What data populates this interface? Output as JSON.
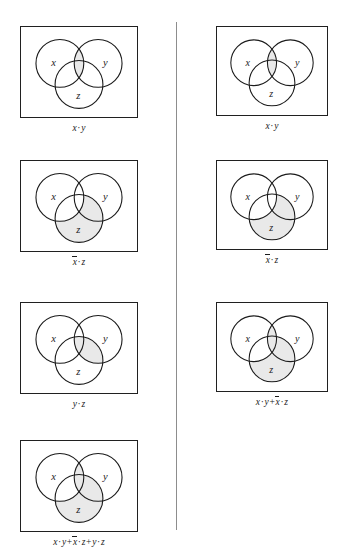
{
  "page": {
    "shade_color": "#e9e9e9",
    "outline_color": "#1b1b1b",
    "divider_color": "#8d8d8d",
    "set_labels": {
      "x": "x",
      "y": "y",
      "z": "z"
    }
  },
  "left_column": {
    "figures": [
      {
        "id": "left-xy",
        "caption": "x · y",
        "caption_parts": [
          {
            "kind": "var",
            "text": "x",
            "bar": false
          },
          {
            "kind": "dot",
            "text": "·"
          },
          {
            "kind": "var",
            "text": "y",
            "bar": false
          }
        ],
        "shaded_regions": [
          "x_and_y_only",
          "x_and_y_and_z"
        ],
        "labels": {
          "x": "x",
          "y": "y",
          "z": "z"
        }
      },
      {
        "id": "left-notx-z",
        "caption": "x̄ · z",
        "caption_parts": [
          {
            "kind": "var",
            "text": "x",
            "bar": true
          },
          {
            "kind": "dot",
            "text": "·"
          },
          {
            "kind": "var",
            "text": "z",
            "bar": false
          }
        ],
        "shaded_regions": [
          "z_only",
          "y_and_z_only"
        ],
        "labels": {
          "x": "x",
          "y": "y",
          "z": "z"
        }
      },
      {
        "id": "left-yz",
        "caption": "y · z",
        "caption_parts": [
          {
            "kind": "var",
            "text": "y",
            "bar": false
          },
          {
            "kind": "dot",
            "text": "·"
          },
          {
            "kind": "var",
            "text": "z",
            "bar": false
          }
        ],
        "shaded_regions": [
          "y_and_z_only",
          "x_and_y_and_z"
        ],
        "labels": {
          "x": "x",
          "y": "y",
          "z": "z"
        }
      },
      {
        "id": "left-sum-three",
        "caption": "x · y + x̄ · z + y · z",
        "caption_parts": [
          {
            "kind": "var",
            "text": "x",
            "bar": false
          },
          {
            "kind": "dot",
            "text": "·"
          },
          {
            "kind": "var",
            "text": "y",
            "bar": false
          },
          {
            "kind": "op",
            "text": "+"
          },
          {
            "kind": "var",
            "text": "x",
            "bar": true
          },
          {
            "kind": "dot",
            "text": "·"
          },
          {
            "kind": "var",
            "text": "z",
            "bar": false
          },
          {
            "kind": "op",
            "text": "+"
          },
          {
            "kind": "var",
            "text": "y",
            "bar": false
          },
          {
            "kind": "dot",
            "text": "·"
          },
          {
            "kind": "var",
            "text": "z",
            "bar": false
          }
        ],
        "shaded_regions": [
          "x_and_y_only",
          "x_and_y_and_z",
          "z_only",
          "y_and_z_only"
        ],
        "labels": {
          "x": "x",
          "y": "y",
          "z": "z"
        }
      }
    ]
  },
  "right_column": {
    "figures": [
      {
        "id": "right-xy",
        "caption": "x · y",
        "caption_parts": [
          {
            "kind": "var",
            "text": "x",
            "bar": false
          },
          {
            "kind": "dot",
            "text": "·"
          },
          {
            "kind": "var",
            "text": "y",
            "bar": false
          }
        ],
        "shaded_regions": [
          "x_and_y_only",
          "x_and_y_and_z"
        ],
        "labels": {
          "x": "x",
          "y": "y",
          "z": "z"
        }
      },
      {
        "id": "right-notx-z",
        "caption": "x̄ · z",
        "caption_parts": [
          {
            "kind": "var",
            "text": "x",
            "bar": true
          },
          {
            "kind": "dot",
            "text": "·"
          },
          {
            "kind": "var",
            "text": "z",
            "bar": false
          }
        ],
        "shaded_regions": [
          "z_only",
          "y_and_z_only"
        ],
        "labels": {
          "x": "x",
          "y": "y",
          "z": "z"
        }
      },
      {
        "id": "right-sum-two",
        "caption": "x · y + x̄ · z",
        "caption_parts": [
          {
            "kind": "var",
            "text": "x",
            "bar": false
          },
          {
            "kind": "dot",
            "text": "·"
          },
          {
            "kind": "var",
            "text": "y",
            "bar": false
          },
          {
            "kind": "op",
            "text": "+"
          },
          {
            "kind": "var",
            "text": "x",
            "bar": true
          },
          {
            "kind": "dot",
            "text": "·"
          },
          {
            "kind": "var",
            "text": "z",
            "bar": false
          }
        ],
        "shaded_regions": [
          "x_and_y_only",
          "x_and_y_and_z",
          "z_only",
          "y_and_z_only"
        ],
        "labels": {
          "x": "x",
          "y": "y",
          "z": "z"
        }
      }
    ]
  }
}
